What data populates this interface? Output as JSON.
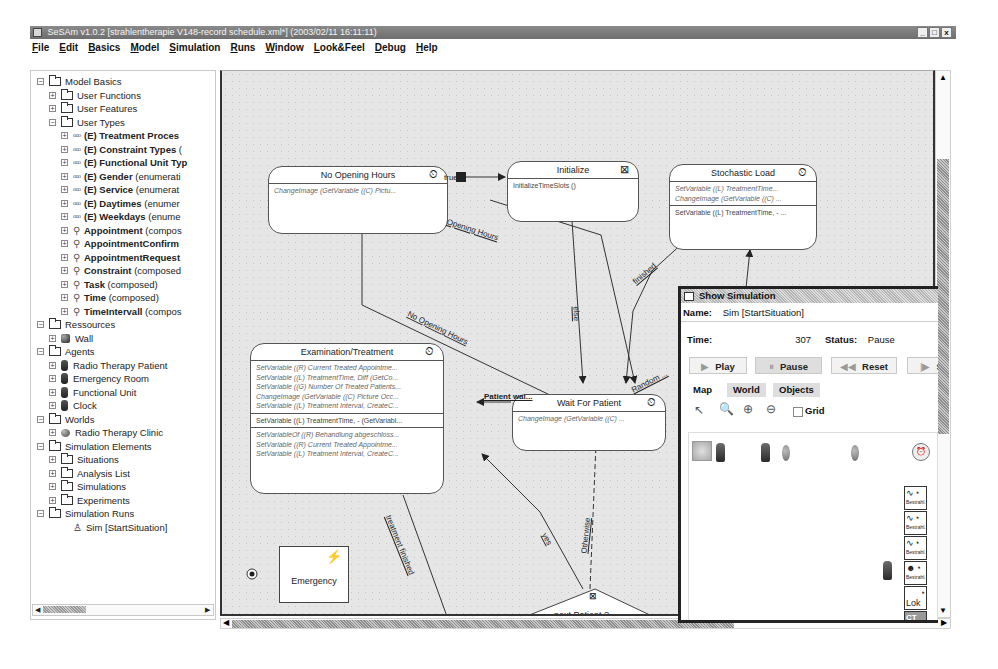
{
  "window": {
    "title": "SeSAm v1.0.2 [strahlentherapie V148-record schedule.xml*] (2003/02/11 16:11:11)",
    "controls": [
      "_",
      "□",
      "x"
    ]
  },
  "menu": [
    "File",
    "Edit",
    "Basics",
    "Model",
    "Simulation",
    "Runs",
    "Window",
    "Look&Feel",
    "Debug",
    "Help"
  ],
  "tree": {
    "items": [
      {
        "level": 0,
        "expander": "-",
        "icon": "folder",
        "label": "Model Basics",
        "bold": false
      },
      {
        "level": 1,
        "expander": "+",
        "icon": "folder",
        "label": "User Functions",
        "bold": false
      },
      {
        "level": 1,
        "expander": "+",
        "icon": "folder",
        "label": "User Features",
        "bold": false
      },
      {
        "level": 1,
        "expander": "-",
        "icon": "folder",
        "label": "User Types",
        "bold": false
      },
      {
        "level": 2,
        "expander": "+",
        "icon": "enum",
        "label": "(E) Treatment Proces",
        "suffix": "",
        "bold": true
      },
      {
        "level": 2,
        "expander": "+",
        "icon": "enum",
        "label": "(E) Constraint Types",
        "suffix": " (",
        "bold": true
      },
      {
        "level": 2,
        "expander": "+",
        "icon": "enum",
        "label": "(E) Functional Unit Typ",
        "suffix": "",
        "bold": true
      },
      {
        "level": 2,
        "expander": "+",
        "icon": "enum",
        "label": "(E) Gender",
        "suffix": " (enumerati",
        "bold": true
      },
      {
        "level": 2,
        "expander": "+",
        "icon": "enum",
        "label": "(E) Service",
        "suffix": " (enumerat",
        "bold": true
      },
      {
        "level": 2,
        "expander": "+",
        "icon": "enum",
        "label": "(E) Daytimes",
        "suffix": " (enumer",
        "bold": true
      },
      {
        "level": 2,
        "expander": "+",
        "icon": "enum",
        "label": "(E) Weekdays",
        "suffix": " (enume",
        "bold": true
      },
      {
        "level": 2,
        "expander": "+",
        "icon": "composed",
        "label": "Appointment",
        "suffix": " (compos",
        "bold": true
      },
      {
        "level": 2,
        "expander": "+",
        "icon": "composed",
        "label": "AppointmentConfirm",
        "suffix": "",
        "bold": true
      },
      {
        "level": 2,
        "expander": "+",
        "icon": "composed",
        "label": "AppointmentRequest",
        "suffix": "",
        "bold": true
      },
      {
        "level": 2,
        "expander": "+",
        "icon": "composed",
        "label": "Constraint",
        "suffix": " (composed",
        "bold": true
      },
      {
        "level": 2,
        "expander": "+",
        "icon": "composed",
        "label": "Task",
        "suffix": " (composed)",
        "bold": true
      },
      {
        "level": 2,
        "expander": "+",
        "icon": "composed",
        "label": "Time",
        "suffix": " (composed)",
        "bold": true
      },
      {
        "level": 2,
        "expander": "+",
        "icon": "composed",
        "label": "TimeIntervall",
        "suffix": " (compos",
        "bold": true
      },
      {
        "level": 0,
        "expander": "-",
        "icon": "folder",
        "label": "Ressources",
        "bold": false
      },
      {
        "level": 1,
        "expander": "+",
        "icon": "resource",
        "label": "Wall",
        "bold": false
      },
      {
        "level": 0,
        "expander": "-",
        "icon": "folder",
        "label": "Agents",
        "bold": false
      },
      {
        "level": 1,
        "expander": "+",
        "icon": "agent",
        "label": "Radio Therapy Patient",
        "bold": false
      },
      {
        "level": 1,
        "expander": "+",
        "icon": "agent",
        "label": "Emergency Room",
        "bold": false
      },
      {
        "level": 1,
        "expander": "+",
        "icon": "agent",
        "label": "Functional Unit",
        "bold": false
      },
      {
        "level": 1,
        "expander": "+",
        "icon": "agent",
        "label": "Clock",
        "bold": false
      },
      {
        "level": 0,
        "expander": "-",
        "icon": "folder",
        "label": "Worlds",
        "bold": false
      },
      {
        "level": 1,
        "expander": "+",
        "icon": "world",
        "label": "Radio Therapy Clinic",
        "bold": false
      },
      {
        "level": 0,
        "expander": "-",
        "icon": "folder",
        "label": "Simulation Elements",
        "bold": false
      },
      {
        "level": 1,
        "expander": "+",
        "icon": "folder",
        "label": "Situations",
        "bold": false
      },
      {
        "level": 1,
        "expander": "+",
        "icon": "folder",
        "label": "Analysis List",
        "bold": false
      },
      {
        "level": 1,
        "expander": "+",
        "icon": "folder",
        "label": "Simulations",
        "bold": false
      },
      {
        "level": 1,
        "expander": "+",
        "icon": "folder",
        "label": "Experiments",
        "bold": false
      },
      {
        "level": 0,
        "expander": "-",
        "icon": "folder",
        "label": "Simulation Runs",
        "bold": false
      },
      {
        "level": 2,
        "expander": "",
        "icon": "run",
        "label": "Sim [StartSituation]",
        "bold": false
      }
    ]
  },
  "diagram": {
    "states": {
      "no_opening_hours": {
        "title": "No Opening Hours",
        "icon": "timer-icon",
        "sections": [
          {
            "style": "italic",
            "lines": [
              "ChangeImage (GetVariable ((C) Pictu..."
            ]
          }
        ]
      },
      "initialize": {
        "title": "Initialize",
        "icon": "start-icon",
        "sections": [
          {
            "style": "normal",
            "lines": [
              "InitializeTimeSlots ()"
            ]
          }
        ]
      },
      "stochastic_load": {
        "title": "Stochastic Load",
        "icon": "timer-icon",
        "sections": [
          {
            "style": "italic",
            "lines": [
              "SetVariable ((L) TreatmentTime...",
              "ChangeImage (GetVariable ((C) ..."
            ]
          },
          {
            "style": "normal",
            "lines": [
              "SetVariable ((L) TreatmentTime, - ..."
            ]
          }
        ]
      },
      "examination": {
        "title": "Examination/Treatment",
        "icon": "timer-icon",
        "sections": [
          {
            "style": "italic",
            "lines": [
              "SetVariable ((R) Current Treated Appointme...",
              "SetVariable ((L) TreatmentTime, Diff (GetCo...",
              "SetVariable ((G) Number Of Treated Patients...",
              "ChangeImage (GetVariable ((C) Picture Occ...",
              "SetVariable ((L) Treatment Interval, CreateC..."
            ]
          },
          {
            "style": "normal",
            "lines": [
              "SetVariable ((L) TreatmentTime, - (GetVariabl..."
            ]
          },
          {
            "style": "italic",
            "lines": [
              "SetVariableOf ((R) Behandlung abgeschloss...",
              "SetVariable ((R) Current Treated Appointme...",
              "SetVariable ((L) Treatment Interval, CreateC..."
            ]
          }
        ]
      },
      "wait_for_patient": {
        "title": "Wait For Patient",
        "icon": "timer-icon",
        "sections": [
          {
            "style": "italic",
            "lines": [
              "ChangeImage (GetVariable ((C) ..."
            ]
          }
        ]
      }
    },
    "edge_labels": {
      "true": "true",
      "opening_hours": "Opening Hours",
      "no_opening_hours": "No Opening Hours",
      "finished": "finished",
      "else": "else",
      "random": "Random ...",
      "patient_wait": "Patient wai...",
      "treatment_finished": "treatment finished",
      "yes": "yes",
      "otherwise": "Otherwise"
    },
    "note": {
      "label": "Emergency",
      "icon": "lightning-icon"
    },
    "decision": {
      "label": "next Patient ?"
    }
  },
  "simulation_window": {
    "title": "Show Simulation",
    "name_label": "Name:",
    "name_value": "Sim [StartSituation]",
    "time_label": "Time:",
    "time_value": "307",
    "status_label": "Status:",
    "status_value": "Pause",
    "buttons": {
      "play": "Play",
      "pause": "Pause",
      "reset": "Reset",
      "step": "S"
    },
    "tabs": [
      "Map",
      "World",
      "Objects"
    ],
    "active_tab": "Map",
    "grid_label": "Grid",
    "grid_checked": false,
    "functional_unit_labels": [
      "Bestrahl.",
      "Bestrahl.",
      "Bestrahl.",
      "Bestrahl.",
      "Lok",
      "CT"
    ]
  }
}
